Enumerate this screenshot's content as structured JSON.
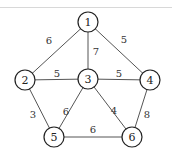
{
  "diagram": {
    "type": "weighted-undirected-graph",
    "nodes": [
      {
        "id": "1",
        "label": "1",
        "x": 88,
        "y": 22
      },
      {
        "id": "2",
        "label": "2",
        "x": 25,
        "y": 80
      },
      {
        "id": "3",
        "label": "3",
        "x": 88,
        "y": 79
      },
      {
        "id": "4",
        "label": "4",
        "x": 150,
        "y": 80
      },
      {
        "id": "5",
        "label": "5",
        "x": 54,
        "y": 137
      },
      {
        "id": "6",
        "label": "6",
        "x": 132,
        "y": 137
      }
    ],
    "edges": [
      {
        "from": "1",
        "to": "2",
        "weight": "6",
        "lx": 49,
        "ly": 40
      },
      {
        "from": "1",
        "to": "3",
        "weight": "7",
        "lx": 96,
        "ly": 51
      },
      {
        "from": "1",
        "to": "4",
        "weight": "5",
        "lx": 124,
        "ly": 39
      },
      {
        "from": "2",
        "to": "3",
        "weight": "5",
        "lx": 57,
        "ly": 73
      },
      {
        "from": "3",
        "to": "4",
        "weight": "5",
        "lx": 119,
        "ly": 73
      },
      {
        "from": "2",
        "to": "5",
        "weight": "3",
        "lx": 33,
        "ly": 114
      },
      {
        "from": "3",
        "to": "5",
        "weight": "6",
        "lx": 66,
        "ly": 111
      },
      {
        "from": "3",
        "to": "6",
        "weight": "4",
        "lx": 114,
        "ly": 110
      },
      {
        "from": "4",
        "to": "6",
        "weight": "8",
        "lx": 147,
        "ly": 114
      },
      {
        "from": "5",
        "to": "6",
        "weight": "6",
        "lx": 93,
        "ly": 129
      }
    ]
  }
}
